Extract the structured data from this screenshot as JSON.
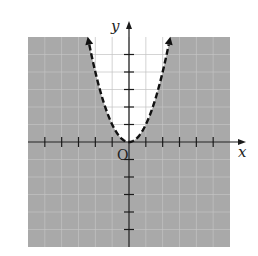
{
  "chart_data": {
    "type": "line",
    "title": "",
    "function": "y = x^2",
    "inequality": "y < x^2",
    "boundary_style": "dashed",
    "shaded_region": "below/outside parabola",
    "xlabel": "x",
    "ylabel": "y",
    "origin_label": "O",
    "xlim": [
      -6,
      6
    ],
    "ylim": [
      -6,
      6
    ],
    "x_ticks": [
      -5,
      -4,
      -3,
      -2,
      -1,
      1,
      2,
      3,
      4,
      5
    ],
    "y_ticks": [
      -5,
      -4,
      -3,
      -2,
      -1,
      1,
      2,
      3,
      4,
      5
    ],
    "grid": true,
    "series": [
      {
        "name": "y = x^2",
        "x": [
          -2.4,
          -2,
          -1.5,
          -1,
          -0.5,
          0,
          0.5,
          1,
          1.5,
          2,
          2.4
        ],
        "y": [
          5.76,
          4,
          2.25,
          1,
          0.25,
          0,
          0.25,
          1,
          2.25,
          4,
          5.76
        ]
      }
    ],
    "colors": {
      "shade": "#a9a9a9",
      "grid_on_shade": "#c4c4c4",
      "grid_on_white": "#cfcfcf",
      "axis": "#1a1a1a",
      "curve": "#111111"
    }
  }
}
